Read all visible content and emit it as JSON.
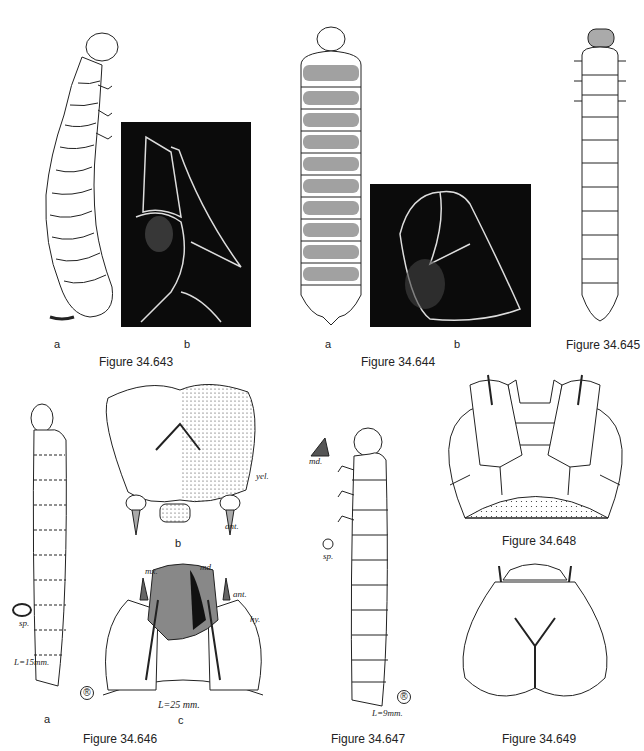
{
  "figures": [
    {
      "id": "34.643",
      "caption": "Figure 34.643",
      "parts": [
        {
          "letter": "a",
          "type": "drawing"
        },
        {
          "letter": "b",
          "type": "photo"
        }
      ]
    },
    {
      "id": "34.644",
      "caption": "Figure 34.644",
      "parts": [
        {
          "letter": "a",
          "type": "drawing"
        },
        {
          "letter": "b",
          "type": "photo"
        }
      ]
    },
    {
      "id": "34.645",
      "caption": "Figure 34.645",
      "parts": []
    },
    {
      "id": "34.646",
      "caption": "Figure 34.646",
      "parts": [
        {
          "letter": "a",
          "type": "drawing"
        },
        {
          "letter": "b",
          "type": "drawing"
        },
        {
          "letter": "c",
          "type": "drawing"
        }
      ],
      "labels": {
        "yel": "yel.",
        "ant_b": "ant.",
        "mx": "mx.",
        "md": "md.",
        "ant_c": "ant.",
        "hy": "hy.",
        "sp": "sp.",
        "length_a": "L=15mm.",
        "length_c": "L=25 mm."
      }
    },
    {
      "id": "34.647",
      "caption": "Figure 34.647",
      "parts": [],
      "labels": {
        "md": "md.",
        "sp": "sp.",
        "length": "L=9mm."
      }
    },
    {
      "id": "34.648",
      "caption": "Figure 34.648",
      "parts": []
    },
    {
      "id": "34.649",
      "caption": "Figure 34.649",
      "parts": []
    }
  ],
  "colors": {
    "ink": "#222222",
    "photo_bg": "#0b0b0b",
    "paper": "#ffffff"
  }
}
